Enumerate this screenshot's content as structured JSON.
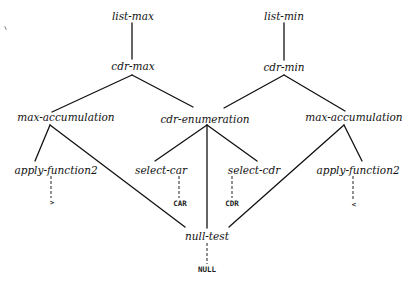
{
  "diagram": {
    "type": "tree",
    "colors": {
      "line": "#111111",
      "text": "#111111",
      "background": "#ffffff"
    },
    "nodes": {
      "list_max": {
        "label": "list-max",
        "x": 133,
        "y": 16
      },
      "list_min": {
        "label": "list-min",
        "x": 284,
        "y": 16
      },
      "cdr_max": {
        "label": "cdr-max",
        "x": 133,
        "y": 66
      },
      "cdr_min": {
        "label": "cdr-min",
        "x": 284,
        "y": 67
      },
      "max_accumulation_left": {
        "label": "max-accumulation",
        "x": 66,
        "y": 117
      },
      "cdr_enumeration": {
        "label": "cdr-enumeration",
        "x": 205,
        "y": 119
      },
      "max_accumulation_right": {
        "label": "max-accumulation",
        "x": 354,
        "y": 117
      },
      "apply_function2_left": {
        "label": "apply-function2",
        "x": 56,
        "y": 170
      },
      "select_car": {
        "label": "select-car",
        "x": 161,
        "y": 170
      },
      "select_cdr": {
        "label": "select-cdr",
        "x": 254,
        "y": 170
      },
      "apply_function2_right": {
        "label": "apply-function2",
        "x": 358,
        "y": 170
      },
      "null_test": {
        "label": "null-test",
        "x": 207,
        "y": 236
      }
    },
    "leaves": {
      "gt": {
        "label": ">",
        "x": 52,
        "y": 203
      },
      "car": {
        "label": "CAR",
        "x": 180,
        "y": 204
      },
      "cdr": {
        "label": "CDR",
        "x": 232,
        "y": 204
      },
      "lt": {
        "label": "<",
        "x": 354,
        "y": 205
      },
      "null": {
        "label": "NULL",
        "x": 207,
        "y": 270
      }
    },
    "edges": [
      {
        "from": "list-max",
        "to": "cdr-max",
        "style": "solid"
      },
      {
        "from": "list-min",
        "to": "cdr-min",
        "style": "solid"
      },
      {
        "from": "cdr-max",
        "to": "max-accumulation (left)",
        "style": "solid"
      },
      {
        "from": "cdr-max",
        "to": "cdr-enumeration",
        "style": "solid"
      },
      {
        "from": "cdr-min",
        "to": "cdr-enumeration",
        "style": "solid"
      },
      {
        "from": "cdr-min",
        "to": "max-accumulation (right)",
        "style": "solid"
      },
      {
        "from": "max-accumulation (left)",
        "to": "apply-function2 (left)",
        "style": "solid"
      },
      {
        "from": "max-accumulation (left)",
        "to": "null-test",
        "style": "solid"
      },
      {
        "from": "cdr-enumeration",
        "to": "select-car",
        "style": "solid"
      },
      {
        "from": "cdr-enumeration",
        "to": "null-test",
        "style": "solid"
      },
      {
        "from": "cdr-enumeration",
        "to": "select-cdr",
        "style": "solid"
      },
      {
        "from": "max-accumulation (right)",
        "to": "apply-function2 (right)",
        "style": "solid"
      },
      {
        "from": "max-accumulation (right)",
        "to": "null-test",
        "style": "solid"
      },
      {
        "from": "apply-function2 (left)",
        "to": ">",
        "style": "dashed"
      },
      {
        "from": "select-car",
        "to": "CAR",
        "style": "dashed"
      },
      {
        "from": "select-cdr",
        "to": "CDR",
        "style": "dashed"
      },
      {
        "from": "apply-function2 (right)",
        "to": "<",
        "style": "dashed"
      },
      {
        "from": "null-test",
        "to": "NULL",
        "style": "dashed"
      }
    ]
  }
}
